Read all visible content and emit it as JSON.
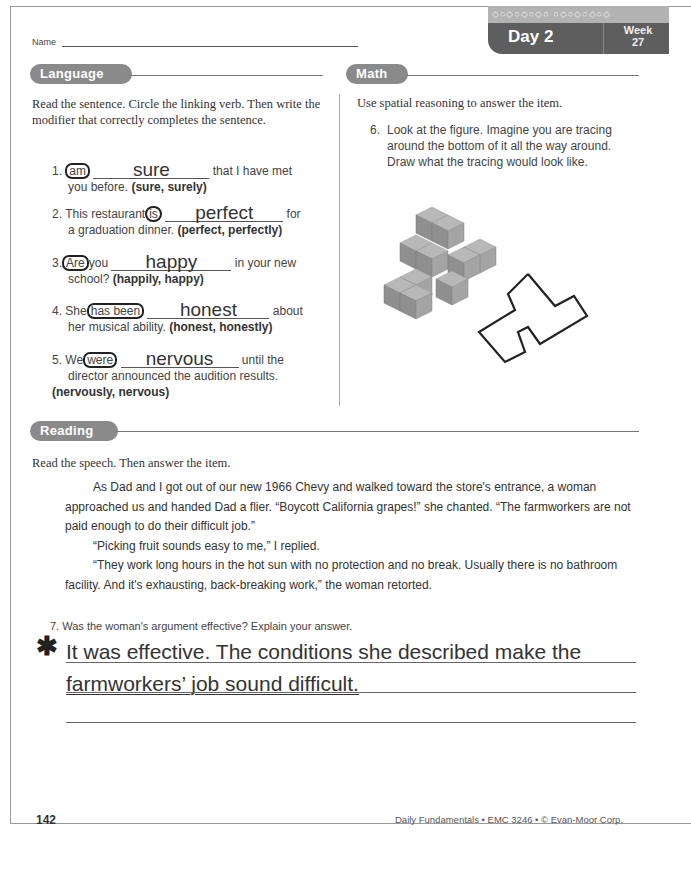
{
  "header": {
    "name_label": "Name",
    "badge": {
      "pattern": "◇○◇○◇○◇○ ○◇○◇○◇○◇",
      "day": "Day 2",
      "week_label": "Week",
      "week_number": "27"
    }
  },
  "language": {
    "title": "Language",
    "instructions": "Read the sentence. Circle the linking verb. Then write the modifier that correctly completes the sentence.",
    "items": [
      {
        "number": "1.",
        "before": "",
        "verb": "am",
        "mid": "",
        "answer": "sure",
        "after": "that I have met",
        "line2": "you before.",
        "options": "(sure, surely)"
      },
      {
        "number": "2.",
        "before": "This restaurant",
        "verb": "is",
        "mid": "",
        "answer": "perfect",
        "after": "for",
        "line2": "a graduation dinner.",
        "options": "(perfect, perfectly)"
      },
      {
        "number": "3.",
        "before": "",
        "verb": "Are",
        "mid": "you",
        "answer": "happy",
        "after": "in your new",
        "line2": "school?",
        "options": "(happily, happy)"
      },
      {
        "number": "4.",
        "before": "She",
        "verb": "has been",
        "mid": "",
        "answer": "honest",
        "after": "about",
        "line2": "her musical ability.",
        "options": "(honest, honestly)"
      },
      {
        "number": "5.",
        "before": "We",
        "verb": "were",
        "mid": "",
        "answer": "nervous",
        "after": "until the",
        "line2": "director announced the audition results.",
        "options": "(nervously, nervous)"
      }
    ]
  },
  "math": {
    "title": "Math",
    "instructions": "Use spatial reasoning to answer the item.",
    "item_number": "6.",
    "item_text": "Look at the figure. Imagine you are tracing around the bottom of it all the way around. Draw what the tracing would look like.",
    "colors": {
      "cube_top": "#b8b8b8",
      "cube_left": "#8f8f8f",
      "cube_right": "#a4a4a4",
      "trace": "#222222"
    }
  },
  "reading": {
    "title": "Reading",
    "instructions": "Read the speech. Then answer the item.",
    "passage": [
      "As Dad and I got out of our new 1966 Chevy and walked toward the store's entrance, a woman approached us and handed Dad a flier. “Boycott California grapes!” she chanted. “The farmworkers are not paid enough to do their difficult job.”",
      "“Picking fruit sounds easy to me,” I replied.",
      "“They work long hours in the hot sun with no protection and no break. Usually there is no bathroom facility. And it's exhausting, back-breaking work,” the woman retorted."
    ],
    "question_number": "7.",
    "question": "Was the woman's argument effective? Explain your answer.",
    "star": "✱",
    "answer_lines": [
      "It was effective. The conditions she described make the",
      "farmworkers’ job sound difficult.",
      ""
    ]
  },
  "footer": {
    "page_number": "142",
    "credit": "Daily Fundamentals • EMC 3246 • © Evan-Moor Corp."
  }
}
